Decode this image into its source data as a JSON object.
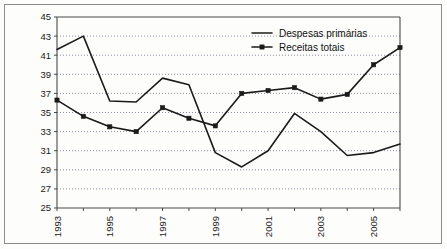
{
  "chart_data": {
    "type": "line",
    "title": "",
    "subtitle": "",
    "xlabel": "",
    "ylabel": "",
    "grid": "horizontal-dotted",
    "legend_position": "top-right",
    "ylim": [
      25,
      45
    ],
    "yticks": [
      25,
      27,
      29,
      31,
      33,
      35,
      37,
      39,
      41,
      43,
      45
    ],
    "ytick_labels": [
      "25",
      "27",
      "29",
      "31",
      "33",
      "35",
      "37",
      "39",
      "41",
      "43",
      "45"
    ],
    "x": [
      1993,
      1994,
      1995,
      1996,
      1997,
      1998,
      1999,
      2000,
      2001,
      2002,
      2003,
      2004,
      2005,
      2006
    ],
    "xtick_labels": [
      "1993",
      "",
      "1995",
      "",
      "1997",
      "",
      "1999",
      "",
      "2001",
      "",
      "2003",
      "",
      "2005",
      ""
    ],
    "xtick_labels_visible": [
      "1993",
      "1995",
      "1997",
      "1999",
      "2001",
      "2003",
      "2005"
    ],
    "xlim": [
      1993,
      2006
    ],
    "series": [
      {
        "name": "Despesas primárias",
        "marker": "none",
        "color": "#1b1b1b",
        "values": [
          41.6,
          43.0,
          36.2,
          36.1,
          38.6,
          37.9,
          30.8,
          29.3,
          31.0,
          34.9,
          33.0,
          30.5,
          30.8,
          31.7
        ]
      },
      {
        "name": "Receitas totais",
        "marker": "square",
        "color": "#1b1b1b",
        "values": [
          36.3,
          34.6,
          33.5,
          33.0,
          35.5,
          34.4,
          33.6,
          37.0,
          37.3,
          37.6,
          36.4,
          36.9,
          40.0,
          41.8
        ]
      }
    ],
    "legend": [
      {
        "label": "Despesas primárias",
        "marker": "none"
      },
      {
        "label": "Receitas totais",
        "marker": "square"
      }
    ]
  },
  "plot_geometry": {
    "left": 57,
    "right": 400,
    "top": 17,
    "bottom": 208
  }
}
